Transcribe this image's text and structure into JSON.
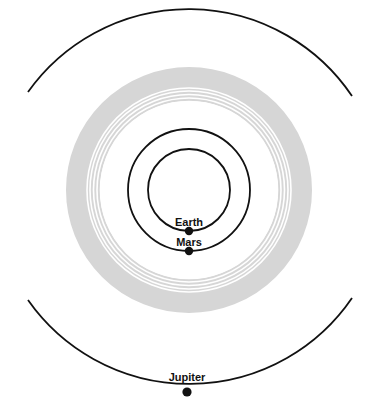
{
  "diagram": {
    "type": "solar-system-orbits",
    "background": "#ffffff",
    "orbit_color": "#111111",
    "belt_color": "#d6d6d6",
    "belt_gap_color": "#ffffff",
    "planets": [
      {
        "name": "Earth",
        "label": "Earth"
      },
      {
        "name": "Mars",
        "label": "Mars"
      },
      {
        "name": "Jupiter",
        "label": "Jupiter"
      }
    ],
    "features": [
      {
        "name": "asteroid-belt",
        "label": ""
      }
    ]
  },
  "labels": {
    "earth": "Earth",
    "mars": "Mars",
    "jupiter": "Jupiter"
  }
}
